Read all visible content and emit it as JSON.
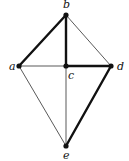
{
  "graph": {
    "vertices": [
      {
        "id": "a",
        "label": "a",
        "x": 19,
        "y": 66,
        "lx": 9,
        "ly": 70
      },
      {
        "id": "b",
        "label": "b",
        "x": 66,
        "y": 15,
        "lx": 63,
        "ly": 8
      },
      {
        "id": "c",
        "label": "c",
        "x": 66,
        "y": 66,
        "lx": 68,
        "ly": 79
      },
      {
        "id": "d",
        "label": "d",
        "x": 111,
        "y": 66,
        "lx": 117,
        "ly": 70
      },
      {
        "id": "e",
        "label": "e",
        "x": 66,
        "y": 146,
        "lx": 63,
        "ly": 159
      }
    ],
    "edges": [
      {
        "from": "a",
        "to": "b",
        "bold": true
      },
      {
        "from": "b",
        "to": "c",
        "bold": true
      },
      {
        "from": "c",
        "to": "d",
        "bold": true
      },
      {
        "from": "d",
        "to": "e",
        "bold": true
      },
      {
        "from": "b",
        "to": "d",
        "bold": false
      },
      {
        "from": "a",
        "to": "c",
        "bold": false
      },
      {
        "from": "a",
        "to": "e",
        "bold": false
      },
      {
        "from": "c",
        "to": "e",
        "bold": false
      }
    ],
    "colors": {
      "edge": "#111111",
      "vertex": "#111111"
    }
  }
}
